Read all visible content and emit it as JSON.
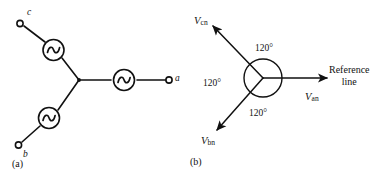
{
  "figure": {
    "background_color": "#ffffff",
    "line_color": "#111111"
  },
  "panel_a": {
    "caption": "(a)",
    "description": "Wye-connected three-phase AC voltage source schematic",
    "terminals": [
      {
        "label": "c",
        "name": "terminal-c"
      },
      {
        "label": "a",
        "name": "terminal-a"
      },
      {
        "label": "b",
        "name": "terminal-b"
      }
    ],
    "sources": [
      {
        "name": "ac-source-c",
        "symbol": "~"
      },
      {
        "name": "ac-source-a",
        "symbol": "~"
      },
      {
        "name": "ac-source-b",
        "symbol": "~"
      }
    ]
  },
  "panel_b": {
    "caption": "(b)",
    "description": "Phasor diagram of three-phase voltages separated by 120 degrees",
    "phasors": [
      {
        "name": "phasor-vcn",
        "main": "V",
        "sub": "cn",
        "angle_deg": 120
      },
      {
        "name": "phasor-van",
        "main": "V",
        "sub": "an",
        "angle_deg": 0
      },
      {
        "name": "phasor-vbn",
        "main": "V",
        "sub": "bn",
        "angle_deg": -120
      }
    ],
    "angle_labels": [
      {
        "name": "angle-label-top",
        "text": "120°"
      },
      {
        "name": "angle-label-left",
        "text": "120°"
      },
      {
        "name": "angle-label-bottom",
        "text": "120°"
      }
    ],
    "reference_line": {
      "line1": "Reference",
      "line2": "line"
    }
  }
}
